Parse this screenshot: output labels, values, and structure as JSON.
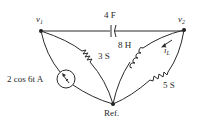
{
  "diagram": {
    "type": "circuit",
    "nodes": {
      "v1": {
        "label": "v",
        "sub": "1"
      },
      "v2": {
        "label": "v",
        "sub": "2"
      },
      "ref": {
        "label": "Ref."
      }
    },
    "components": {
      "capacitor": {
        "label": "4 F",
        "between": "v1-v2"
      },
      "resistor_3s": {
        "label": "3 S",
        "between": "v1-ref"
      },
      "inductor": {
        "label": "8 H",
        "between": "v2-ref"
      },
      "resistor_5s": {
        "label": "5 S",
        "between": "v2-ref"
      },
      "current_source": {
        "label": "2 cos 6t A",
        "between": "v1-ref"
      }
    },
    "current_label": {
      "label": "i",
      "sub": "L"
    }
  }
}
